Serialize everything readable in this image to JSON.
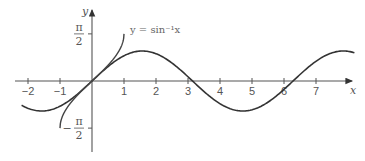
{
  "chart_data": {
    "type": "line",
    "title": "",
    "xlabel": "x",
    "ylabel": "y",
    "xlim": [
      -2.2,
      8.2
    ],
    "ylim": [
      -1.9,
      1.9
    ],
    "grid": false,
    "x_ticks": [
      "-2",
      "-1",
      "1",
      "2",
      "3",
      "4",
      "5",
      "6",
      "7"
    ],
    "y_ticks": [
      {
        "value": 1.5708,
        "label_num": "π",
        "label_den": "2",
        "sign": ""
      },
      {
        "value": -1.5708,
        "label_num": "π",
        "label_den": "2",
        "sign": "−"
      }
    ],
    "series": [
      {
        "name": "y = sin x",
        "domain": [
          -2.2,
          8.2
        ],
        "color": "#333333"
      },
      {
        "name": "y = sin⁻¹x",
        "domain": [
          -1,
          1
        ],
        "color": "#444444"
      }
    ],
    "annotations": [
      {
        "text": "y = sin⁻¹x",
        "x": 1.05,
        "y": 1.55
      }
    ]
  },
  "labels": {
    "x_axis": "x",
    "y_axis": "y",
    "curve_label": "y = sin⁻¹x",
    "pi": "π",
    "two": "2",
    "minus": "−"
  }
}
